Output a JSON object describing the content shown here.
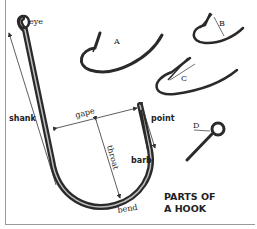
{
  "title": {
    "line1": "PARTS OF",
    "line2": "A HOOK"
  },
  "labels": {
    "eye": "eye",
    "shank": "shank",
    "gape": "gape",
    "throat": "throat",
    "point": "point",
    "barb": "barb",
    "bend": "bend"
  },
  "variants": [
    {
      "id": "A",
      "label": "A"
    },
    {
      "id": "B",
      "label": "B"
    },
    {
      "id": "C",
      "label": "C"
    },
    {
      "id": "D",
      "label": "D"
    }
  ],
  "colors": {
    "hook_dark": "#2a2a2a",
    "hook_light": "#9a9a9a",
    "line": "#333333",
    "frame": "#9a9a9a"
  }
}
